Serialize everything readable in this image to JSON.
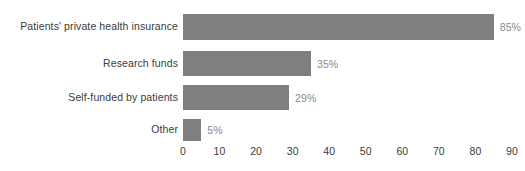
{
  "chart_data": {
    "type": "bar",
    "orientation": "horizontal",
    "title": "",
    "subtitle": "",
    "xlabel": "",
    "ylabel": "",
    "categories": [
      "Patients' private health insurance",
      "Research funds",
      "Self-funded by patients",
      "Other"
    ],
    "values": [
      85,
      35,
      29,
      5
    ],
    "value_labels": [
      "85%",
      "35%",
      "29%",
      "5%"
    ],
    "xlim": [
      0,
      90
    ],
    "xticks": [
      0,
      10,
      20,
      30,
      40,
      50,
      60,
      70,
      80,
      90
    ],
    "xtick_labels": [
      "0",
      "10",
      "20",
      "30",
      "40",
      "50",
      "60",
      "70",
      "80",
      "90"
    ],
    "grid": false,
    "legend": false,
    "legend_position": "none",
    "colors": {
      "bar": "#7f7f7f",
      "category_label": "#3b3b3b",
      "value_label": "#8a8a8a",
      "tick_label": "#3b3b3b",
      "background": "#ffffff"
    }
  }
}
